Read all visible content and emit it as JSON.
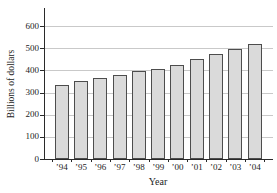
{
  "chart_data": {
    "type": "bar",
    "title": "",
    "xlabel": "Year",
    "ylabel": "Billions of dollars",
    "categories": [
      "’94",
      "’95",
      "’96",
      "’97",
      "’98",
      "’99",
      "’00",
      "’01",
      "’02",
      "’03",
      "’04"
    ],
    "values": [
      335,
      350,
      365,
      380,
      395,
      405,
      425,
      450,
      475,
      495,
      520
    ],
    "ylim": [
      0,
      600
    ],
    "yticks": [
      0,
      100,
      200,
      300,
      400,
      500,
      600
    ],
    "grid": true,
    "legend": false
  },
  "colors": {
    "background": "#ffffff",
    "bar_fill": "#dadada",
    "bar_border": "#4d4d4d",
    "gridline": "#c9c9c9",
    "axis": "#2a2a2a",
    "text": "#1c1c1c"
  }
}
